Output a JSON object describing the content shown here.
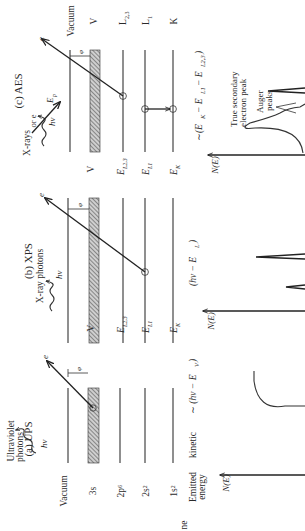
{
  "figure": {
    "orientation": "rotated-90-ccw",
    "panels": [
      {
        "id": "ups",
        "title": "(a) UPS",
        "source_label": "Ultraviolet photons",
        "source_label_line1": "Ultraviolet",
        "source_label_line2": "photons",
        "photon_symbol": "hν",
        "electron_symbol": "e",
        "work_function_symbol": "φ",
        "levels": [
          {
            "label": "Vacuum"
          },
          {
            "label": "3s"
          },
          {
            "label": "2p⁶"
          },
          {
            "label": "2s²"
          },
          {
            "label": "1s²"
          }
        ],
        "kinetic_energy_row_label_line1": "Emitted",
        "kinetic_energy_row_label_line2": "energy",
        "kinetic_energy_row_label_word": "kinetic",
        "kinetic_energy_formula": "~ (hν − E_V)",
        "kinetic_energy_formula_display": "∼ (hν − E",
        "kinetic_energy_formula_sub": "V",
        "spectrum_axis_label": "N(E)",
        "spectrum_shape": "broad valence band curve"
      },
      {
        "id": "xps",
        "title": "(b) XPS",
        "source_label": "X-ray photons",
        "photon_symbol": "hν",
        "electron_symbol": "e",
        "work_function_symbol": "φ",
        "levels": [
          {
            "label": "V"
          },
          {
            "label": "E",
            "sub": "L2,3"
          },
          {
            "label": "E",
            "sub": "L1"
          },
          {
            "label": "E",
            "sub": "K"
          }
        ],
        "kinetic_energy_formula": "(hν − E_L)",
        "kinetic_energy_formula_display": "(hν − E",
        "kinetic_energy_formula_sub": "L",
        "spectrum_axis_label": "N(E)",
        "spectrum_shape": "sharp photoelectron peaks"
      },
      {
        "id": "aes",
        "title": "(c) AES",
        "source_label": "X-rays or e",
        "source_label_line1": "X-rays",
        "source_label_line2": "or e",
        "photon_symbol": "hν",
        "primary_energy_symbol": "E",
        "primary_energy_sub": "p",
        "electron_symbol": "e",
        "work_function_symbol": "φ",
        "levels_left": [
          {
            "label": "V"
          },
          {
            "label": "E",
            "sub": "L2,3"
          },
          {
            "label": "E",
            "sub": "L1"
          },
          {
            "label": "E",
            "sub": "K"
          }
        ],
        "levels_right": [
          {
            "label": "Vacuum"
          },
          {
            "label": "V"
          },
          {
            "label": "L",
            "sub": "2,3"
          },
          {
            "label": "L",
            "sub": "1"
          },
          {
            "label": "K"
          }
        ],
        "kinetic_energy_formula": "~(E_K − E_L1 − E_L2,3)",
        "kinetic_energy_formula_display": "∼(E",
        "kinetic_energy_formula_parts": [
          "K",
          "− E",
          "L1",
          "− E",
          "L2,3",
          ")"
        ],
        "spectrum_axis_label": "N(E)",
        "spectrum_annotations": [
          {
            "text_line1": "True secondary",
            "text_line2": "electron peak"
          },
          {
            "text_line1": "Auger",
            "text_line2": "peaks"
          }
        ]
      }
    ],
    "edge_fragment_label": "ne"
  }
}
